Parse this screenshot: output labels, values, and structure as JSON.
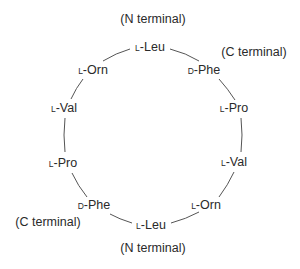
{
  "diagram": {
    "stroke_color": "#555555",
    "terminals": [
      {
        "id": "top-n",
        "text": "(N terminal)",
        "x": 153,
        "y": 19
      },
      {
        "id": "top-c",
        "text": "(C terminal)",
        "x": 254,
        "y": 52
      },
      {
        "id": "bottom-c",
        "text": "(C terminal)",
        "x": 48,
        "y": 222
      },
      {
        "id": "bottom-n",
        "text": "(N terminal)",
        "x": 153,
        "y": 248
      }
    ],
    "residues": [
      {
        "prefix": "L",
        "name": "-Leu",
        "x": 150,
        "y": 47
      },
      {
        "prefix": "D",
        "name": "-Phe",
        "x": 204,
        "y": 70
      },
      {
        "prefix": "L",
        "name": "-Pro",
        "x": 234,
        "y": 108
      },
      {
        "prefix": "L",
        "name": "-Val",
        "x": 234,
        "y": 162
      },
      {
        "prefix": "L",
        "name": "-Orn",
        "x": 206,
        "y": 205
      },
      {
        "prefix": "L",
        "name": "-Leu",
        "x": 151,
        "y": 225
      },
      {
        "prefix": "D",
        "name": "-Phe",
        "x": 94,
        "y": 205
      },
      {
        "prefix": "L",
        "name": "-Pro",
        "x": 63,
        "y": 163
      },
      {
        "prefix": "L",
        "name": "-Val",
        "x": 64,
        "y": 108
      },
      {
        "prefix": "L",
        "name": "-Orn",
        "x": 93,
        "y": 70
      }
    ]
  }
}
